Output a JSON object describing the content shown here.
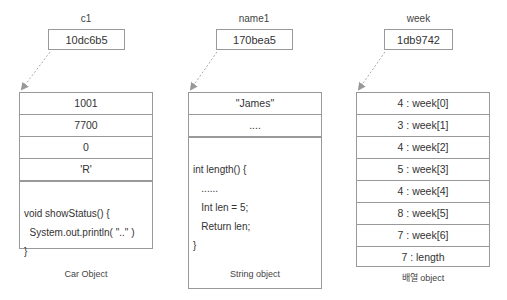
{
  "columns": [
    {
      "var_name": "c1",
      "ref": "10dc6b5",
      "rows": [
        "1001",
        "7700",
        "0",
        "'R'"
      ],
      "code_lines": [
        "void showStatus() {",
        "  System.out.println( \"..\" )",
        "}"
      ],
      "caption": "Car Object"
    },
    {
      "var_name": "name1",
      "ref": "170bea5",
      "rows": [
        "\"James\"",
        "...."
      ],
      "code_lines": [
        "int length() {",
        "   ......",
        "   Int len = 5;",
        "   Return len;",
        "}"
      ],
      "caption": "String object"
    },
    {
      "var_name": "week",
      "ref": "1db9742",
      "rows": [
        "4 : week[0]",
        "3 : week[1]",
        "4 : week[2]",
        "5 : week[3]",
        "4 : week[4]",
        "8 : week[5]",
        "7 : week[6]",
        "7 : length"
      ],
      "caption": "배열 object"
    }
  ],
  "colors": {
    "border": "#999999",
    "arrow": "#aaaaaa",
    "text": "#333333"
  }
}
